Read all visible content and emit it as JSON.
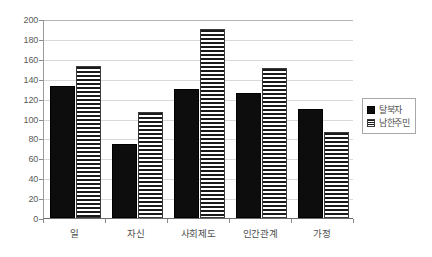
{
  "chart_data": {
    "type": "bar",
    "title": "",
    "subtitle": "",
    "xlabel": "",
    "ylabel": "",
    "categories": [
      "일",
      "자신",
      "사회제도",
      "인간관계",
      "가정"
    ],
    "series": [
      {
        "name": "탈북자",
        "values": [
          133,
          74,
          130,
          126,
          110
        ],
        "fill": "solid-black",
        "color": "#0d0d0d"
      },
      {
        "name": "남한주민",
        "values": [
          153,
          107,
          190,
          151,
          86
        ],
        "fill": "horizontal-stripes",
        "color": "#1a1a1a"
      }
    ],
    "ylim": [
      0,
      200
    ],
    "ytick_step": 20,
    "ytick_labels": [
      "0",
      "20",
      "40",
      "60",
      "80",
      "100",
      "120",
      "140",
      "160",
      "180",
      "200"
    ],
    "grid": "horizontal",
    "legend_position": "right",
    "legend_box": true,
    "background": "#ffffff",
    "axis_color": "#8a8a8a",
    "gridline_color": "#d9d9d9"
  }
}
